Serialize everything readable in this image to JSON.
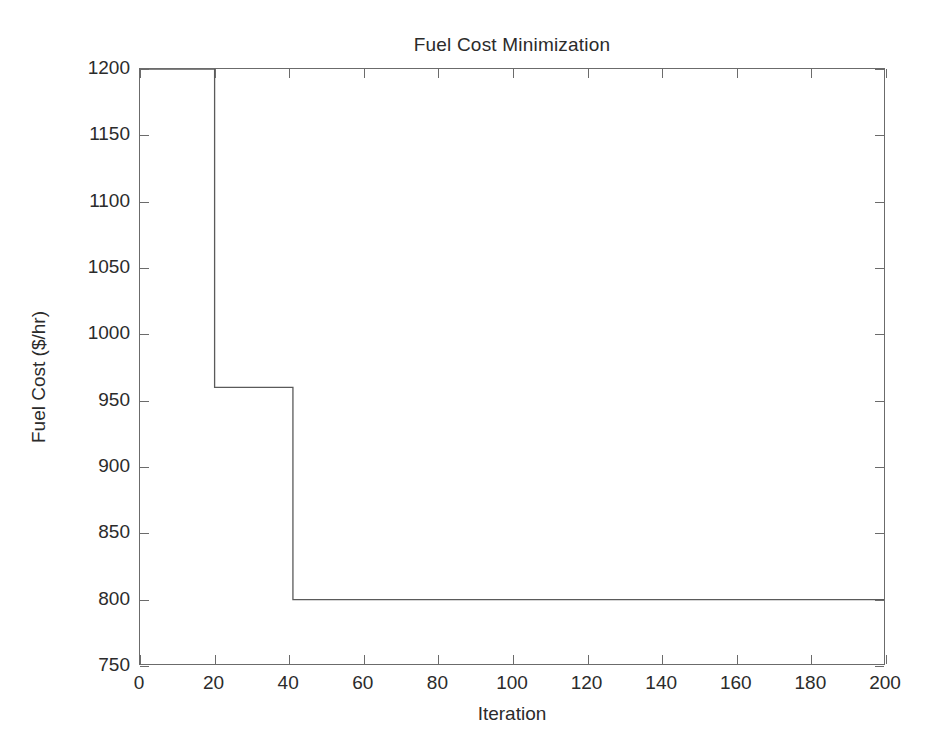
{
  "chart_data": {
    "type": "line",
    "title": "Fuel Cost Minimization",
    "xlabel": "Iteration",
    "ylabel": "Fuel Cost ($/hr)",
    "xlim": [
      0,
      200
    ],
    "ylim": [
      750,
      1200
    ],
    "xticks": [
      0,
      20,
      40,
      60,
      80,
      100,
      120,
      140,
      160,
      180,
      200
    ],
    "yticks": [
      750,
      800,
      850,
      900,
      950,
      1000,
      1050,
      1100,
      1150,
      1200
    ],
    "grid": false,
    "legend": null,
    "line_color": "#5a5a5a",
    "line_width": 1.3,
    "step_style": "post",
    "series": [
      {
        "name": "Best fuel cost",
        "x": [
          0,
          20,
          20,
          41,
          41,
          200
        ],
        "y": [
          1200,
          1200,
          960,
          960,
          800,
          800
        ]
      }
    ],
    "steps": [
      {
        "from_iteration": 0,
        "to_iteration": 20,
        "value": 1200
      },
      {
        "from_iteration": 20,
        "to_iteration": 41,
        "value": 960
      },
      {
        "from_iteration": 41,
        "to_iteration": 200,
        "value": 800
      }
    ],
    "annotations": []
  },
  "axis": {
    "x_tick_labels": [
      "0",
      "20",
      "40",
      "60",
      "80",
      "100",
      "120",
      "140",
      "160",
      "180",
      "200"
    ],
    "y_tick_labels": [
      "750",
      "800",
      "850",
      "900",
      "950",
      "1000",
      "1050",
      "1100",
      "1150",
      "1200"
    ]
  },
  "colors": {
    "axis": "#6b6b6b",
    "text": "#2b2b2b",
    "background": "#ffffff",
    "data_line": "#5a5a5a"
  }
}
